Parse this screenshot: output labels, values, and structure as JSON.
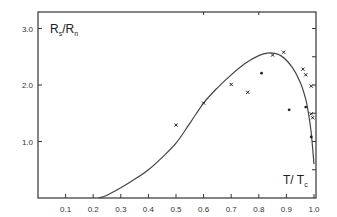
{
  "chart_data": {
    "type": "scatter",
    "title": "",
    "xlabel": "T/T_c",
    "ylabel": "R_s/R_n",
    "xlim": [
      0,
      1.0
    ],
    "ylim": [
      0,
      3.2
    ],
    "grid": false,
    "legend": null,
    "x_ticks": [
      "0.1",
      "0.2",
      "0.3",
      "0.4",
      "0.5",
      "0.6",
      "0.7",
      "0.8",
      "0.9",
      "1.0"
    ],
    "y_ticks": [
      "1.0",
      "2.0",
      "3.0"
    ],
    "series": [
      {
        "name": "theory curve",
        "kind": "line",
        "x": [
          0.22,
          0.25,
          0.3,
          0.35,
          0.4,
          0.45,
          0.5,
          0.55,
          0.6,
          0.65,
          0.7,
          0.75,
          0.8,
          0.84,
          0.88,
          0.92,
          0.95,
          0.97,
          0.98,
          0.99,
          1.0
        ],
        "y": [
          0.0,
          0.05,
          0.18,
          0.33,
          0.5,
          0.72,
          0.97,
          1.32,
          1.68,
          1.95,
          2.18,
          2.38,
          2.52,
          2.57,
          2.52,
          2.32,
          2.05,
          1.75,
          1.5,
          1.15,
          0.6
        ]
      },
      {
        "name": "data (x markers)",
        "kind": "scatter",
        "marker": "x",
        "x": [
          0.5,
          0.6,
          0.7,
          0.76,
          0.85,
          0.89,
          0.96,
          0.97,
          0.99,
          0.99,
          0.995
        ],
        "y": [
          1.29,
          1.68,
          2.01,
          1.87,
          2.53,
          2.58,
          2.28,
          2.18,
          1.98,
          1.49,
          1.42
        ]
      },
      {
        "name": "data (dot markers)",
        "kind": "scatter",
        "marker": "dot",
        "x": [
          0.81,
          0.91,
          0.97,
          0.99
        ],
        "y": [
          2.21,
          1.56,
          1.61,
          1.08
        ]
      }
    ]
  },
  "labels": {
    "y_axis_main": "R",
    "y_axis_sub1": "s",
    "y_axis_slash": "/",
    "y_axis_main2": "R",
    "y_axis_sub2": "n",
    "x_axis_main": "T/ T",
    "x_axis_sub": "c"
  }
}
